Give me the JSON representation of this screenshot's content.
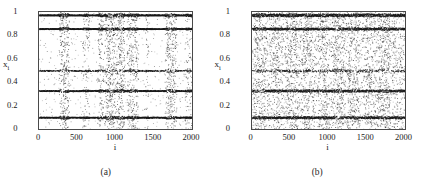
{
  "figure": {
    "background_color": "#ffffff",
    "point_color": "#1a1a1a",
    "axis_color": "#4a4a4a"
  },
  "chart_data": [
    {
      "type": "scatter",
      "panel_id": "a",
      "subcaption": "(a)",
      "title": "",
      "xlabel": "i",
      "ylabel": "x_i",
      "ylabel_base": "x",
      "ylabel_sub": "i",
      "xlim": [
        0,
        2000
      ],
      "ylim": [
        0,
        1
      ],
      "xticks": [
        0,
        500,
        1000,
        1500,
        2000
      ],
      "xticklabels": [
        "0",
        "500",
        "1000",
        "1500",
        "2000"
      ],
      "yticks": [
        0,
        0.2,
        0.4,
        0.6,
        0.8,
        1
      ],
      "yticklabels": [
        "0",
        "0.2",
        "0.4",
        "0.6",
        "0.8",
        "1"
      ],
      "grid": false,
      "legend": false,
      "marker": "dot",
      "marker_size": 0.9,
      "n_points": 2000,
      "description": "Spatiotemporal plot of coupled map lattice showing five dense horizontal attractor bands with intermittent turbulent bursts between them.",
      "bands": [
        {
          "y": 0.975,
          "thickness": 0.012,
          "density": 1.0,
          "continuity": 0.99
        },
        {
          "y": 0.858,
          "thickness": 0.01,
          "density": 0.96,
          "continuity": 0.94
        },
        {
          "y": 0.5,
          "thickness": 0.01,
          "density": 0.62,
          "continuity": 0.46
        },
        {
          "y": 0.328,
          "thickness": 0.01,
          "density": 0.88,
          "continuity": 0.84
        },
        {
          "y": 0.1,
          "thickness": 0.01,
          "density": 0.94,
          "continuity": 0.9
        }
      ],
      "burst_regions": [
        {
          "x_start": 255,
          "x_end": 395,
          "strength": 0.85
        },
        {
          "x_start": 560,
          "x_end": 660,
          "strength": 0.35
        },
        {
          "x_start": 760,
          "x_end": 840,
          "strength": 0.55
        },
        {
          "x_start": 850,
          "x_end": 1000,
          "strength": 0.95
        },
        {
          "x_start": 1000,
          "x_end": 1120,
          "strength": 0.9
        },
        {
          "x_start": 1140,
          "x_end": 1300,
          "strength": 0.7
        },
        {
          "x_start": 1380,
          "x_end": 1430,
          "strength": 0.25
        },
        {
          "x_start": 1640,
          "x_end": 1800,
          "strength": 0.8
        },
        {
          "x_start": 1900,
          "x_end": 2000,
          "strength": 0.4
        }
      ],
      "background_scatter_density": 0.1,
      "seed": 17
    },
    {
      "type": "scatter",
      "panel_id": "b",
      "subcaption": "(b)",
      "title": "",
      "xlabel": "i",
      "ylabel": "x_i",
      "ylabel_base": "x",
      "ylabel_sub": "i",
      "xlim": [
        0,
        2000
      ],
      "ylim": [
        0,
        1
      ],
      "xticks": [
        0,
        500,
        1000,
        1500,
        2000
      ],
      "xticklabels": [
        "0",
        "500",
        "1000",
        "1500",
        "2000"
      ],
      "yticks": [
        0,
        0.2,
        0.4,
        0.6,
        0.8,
        1
      ],
      "yticklabels": [
        "0",
        "0.2",
        "0.4",
        "0.6",
        "0.8",
        "1"
      ],
      "grid": false,
      "legend": false,
      "marker": "dot",
      "marker_size": 0.9,
      "n_points": 2000,
      "description": "Same lattice with stronger coupling: the five attractor bands persist but turbulent scatter is spread nearly uniformly across all i.",
      "bands": [
        {
          "y": 0.975,
          "thickness": 0.012,
          "density": 1.0,
          "continuity": 0.99
        },
        {
          "y": 0.858,
          "thickness": 0.01,
          "density": 0.95,
          "continuity": 0.92
        },
        {
          "y": 0.5,
          "thickness": 0.01,
          "density": 0.58,
          "continuity": 0.42
        },
        {
          "y": 0.328,
          "thickness": 0.01,
          "density": 0.86,
          "continuity": 0.8
        },
        {
          "y": 0.1,
          "thickness": 0.01,
          "density": 0.92,
          "continuity": 0.88
        }
      ],
      "burst_regions": [
        {
          "x_start": 0,
          "x_end": 200,
          "strength": 0.8
        },
        {
          "x_start": 200,
          "x_end": 420,
          "strength": 0.55
        },
        {
          "x_start": 420,
          "x_end": 620,
          "strength": 0.7
        },
        {
          "x_start": 620,
          "x_end": 820,
          "strength": 0.6
        },
        {
          "x_start": 820,
          "x_end": 1020,
          "strength": 0.65
        },
        {
          "x_start": 1020,
          "x_end": 1220,
          "strength": 0.75
        },
        {
          "x_start": 1220,
          "x_end": 1420,
          "strength": 0.7
        },
        {
          "x_start": 1420,
          "x_end": 1620,
          "strength": 0.55
        },
        {
          "x_start": 1620,
          "x_end": 1820,
          "strength": 0.78
        },
        {
          "x_start": 1820,
          "x_end": 2000,
          "strength": 0.5
        }
      ],
      "background_scatter_density": 0.3,
      "seed": 43
    }
  ]
}
